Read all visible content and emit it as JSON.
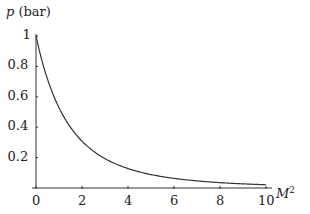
{
  "chart_data": {
    "type": "line",
    "title": "",
    "xlabel": "M²",
    "ylabel": "p (bar)",
    "xlim": [
      0,
      10
    ],
    "ylim": [
      0,
      1
    ],
    "x_ticks": [
      "0",
      "2",
      "4",
      "6",
      "8",
      "10"
    ],
    "y_ticks": [
      "0.2",
      "0.4",
      "0.6",
      "0.8",
      "1"
    ],
    "grid": false,
    "legend": null,
    "series": [
      {
        "name": "p",
        "x": [
          0,
          0.5,
          1,
          1.5,
          2,
          3,
          4,
          5,
          6,
          7,
          8,
          9,
          10
        ],
        "values": [
          1.0,
          0.72,
          0.53,
          0.4,
          0.31,
          0.19,
          0.13,
          0.087,
          0.063,
          0.046,
          0.035,
          0.027,
          0.021
        ]
      }
    ]
  },
  "labels": {
    "ylabel_var": "p",
    "ylabel_unit": "(bar)",
    "xlabel_var": "M",
    "xlabel_exp": "2"
  },
  "colors": {
    "axis": "#333333",
    "curve": "#333333",
    "text": "#222222"
  }
}
